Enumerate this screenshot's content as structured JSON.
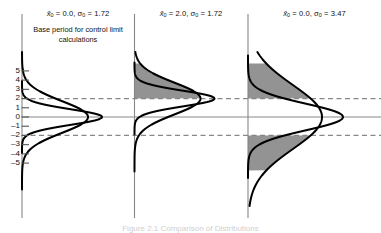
{
  "figure": {
    "caption": "Figure 2.1  Comparison of Distributions",
    "background_color": "#ffffff",
    "line_color": "#000000",
    "axis_color": "#888888",
    "shade_color": "#808080"
  },
  "axis": {
    "label": "",
    "tick_labels": [
      "5",
      "4",
      "3",
      "2",
      "1",
      "0",
      "–1",
      "–2",
      "–3",
      "–4",
      "–5"
    ],
    "tick_values": [
      5,
      4,
      3,
      2,
      1,
      0,
      -1,
      -2,
      -3,
      -4,
      -5
    ],
    "range": [
      -5.8,
      5.8
    ],
    "center_line_value": 0,
    "control_limits": [
      2,
      -2
    ]
  },
  "panels": [
    {
      "id": "panel-1",
      "title": "x̅0 = 0.0, σ0 = 1.72",
      "title_parts": {
        "mean_symbol": "x",
        "mean_sub": "0",
        "mean_value": "0.0",
        "sigma_symbol": "σ",
        "sigma_sub": "0",
        "sigma_value": "1.72"
      },
      "note": "Base period for control limit calculations",
      "shaded": []
    },
    {
      "id": "panel-2",
      "title": "x̅0 = 2.0, σ0 = 1.72",
      "title_parts": {
        "mean_symbol": "x",
        "mean_sub": "0",
        "mean_value": "2.0",
        "sigma_symbol": "σ",
        "sigma_sub": "0",
        "sigma_value": "1.72"
      },
      "note": "",
      "shaded": [
        "above-upper-limit"
      ]
    },
    {
      "id": "panel-3",
      "title": "x̅0 = 0.0, σ0 = 3.47",
      "title_parts": {
        "mean_symbol": "x",
        "mean_sub": "0",
        "mean_value": "0.0",
        "sigma_symbol": "σ",
        "sigma_sub": "0",
        "sigma_value": "3.47"
      },
      "note": "",
      "shaded": [
        "above-upper-limit",
        "below-lower-limit"
      ]
    }
  ],
  "chart_data": {
    "type": "line",
    "title": "Comparison of Distributions",
    "subtitle": "",
    "xlabel": "",
    "ylabel": "",
    "orientation": "horizontal-density",
    "ylim": [
      -5.8,
      5.8
    ],
    "grid": false,
    "legend_position": "none",
    "control_limits": {
      "upper": 2,
      "lower": -2,
      "center": 0,
      "style": "dashed"
    },
    "tick_labels": [
      "5",
      "4",
      "3",
      "2",
      "1",
      "0",
      "–1",
      "–2",
      "–3",
      "–4",
      "–5"
    ],
    "panels": [
      {
        "name": "x̅0 = 0.0, σ0 = 1.72",
        "note": "Base period for control limit calculations",
        "series": [
          {
            "name": "narrow",
            "distribution": "normal",
            "mean": 0.0,
            "sigma": 0.85,
            "peak_width_px": 80
          },
          {
            "name": "wide",
            "distribution": "normal",
            "mean": 0.0,
            "sigma": 1.72,
            "peak_width_px": 66
          }
        ],
        "shaded_tails": []
      },
      {
        "name": "x̅0 = 2.0, σ0 = 1.72",
        "note": "",
        "series": [
          {
            "name": "narrow",
            "distribution": "normal",
            "mean": 2.0,
            "sigma": 0.85,
            "peak_width_px": 80
          },
          {
            "name": "wide",
            "distribution": "normal",
            "mean": 2.0,
            "sigma": 1.72,
            "peak_width_px": 66
          }
        ],
        "shaded_tails": [
          {
            "side": "upper",
            "from": 2,
            "to": 5.8
          }
        ]
      },
      {
        "name": "x̅0 = 0.0, σ0 = 3.47",
        "note": "",
        "series": [
          {
            "name": "narrow",
            "distribution": "normal",
            "mean": 0.0,
            "sigma": 1.45,
            "peak_width_px": 95
          },
          {
            "name": "wide",
            "distribution": "normal",
            "mean": 0.0,
            "sigma": 3.47,
            "peak_width_px": 74
          }
        ],
        "shaded_tails": [
          {
            "side": "upper",
            "from": 2,
            "to": 5.8
          },
          {
            "side": "lower",
            "from": -5.8,
            "to": -2
          }
        ]
      }
    ]
  }
}
